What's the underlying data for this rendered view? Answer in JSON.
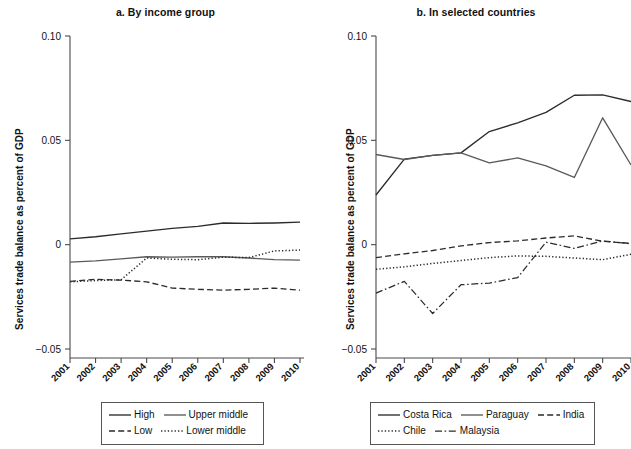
{
  "figure": {
    "background": "#ffffff",
    "line_color": "#2b2b2b",
    "gray_line_color": "#5a5a5a",
    "axis_color": "#4a4a4a"
  },
  "chart_data": [
    {
      "type": "line",
      "panel_id": "a",
      "title": "a. By income group",
      "xlabel": "",
      "ylabel": "Services trade balance as percent of GDP",
      "x": [
        2001,
        2002,
        2003,
        2004,
        2005,
        2006,
        2007,
        2008,
        2009,
        2010
      ],
      "xtick_labels": [
        "2001",
        "2002",
        "2003",
        "2004",
        "2005",
        "2006",
        "2007",
        "2008",
        "2009",
        "2010"
      ],
      "ytick_labels": [
        "0.10",
        "0.05",
        "0",
        "-0.05"
      ],
      "ytick_values": [
        0.1,
        0.05,
        0,
        -0.05
      ],
      "ylim": [
        -0.05,
        0.1
      ],
      "grid": false,
      "legend_position": "bottom",
      "series": [
        {
          "name": "High",
          "style": "solid",
          "color": "#2b2b2b",
          "values": [
            0.0028,
            0.0038,
            0.0052,
            0.0065,
            0.0078,
            0.0088,
            0.0104,
            0.0102,
            0.0104,
            0.0108
          ]
        },
        {
          "name": "Upper middle",
          "style": "solid",
          "color": "#5a5a5a",
          "values": [
            -0.0084,
            -0.0078,
            -0.0068,
            -0.0058,
            -0.006,
            -0.0058,
            -0.0058,
            -0.0064,
            -0.0072,
            -0.0074
          ]
        },
        {
          "name": "Low",
          "style": "dashed",
          "color": "#2b2b2b",
          "values": [
            -0.0176,
            -0.0166,
            -0.017,
            -0.0178,
            -0.0208,
            -0.0214,
            -0.0218,
            -0.0214,
            -0.0208,
            -0.0218
          ]
        },
        {
          "name": "Lower middle",
          "style": "dotted",
          "color": "#2b2b2b",
          "values": [
            -0.0178,
            -0.0172,
            -0.0168,
            -0.0064,
            -0.007,
            -0.0072,
            -0.006,
            -0.0062,
            -0.003,
            -0.0026
          ]
        }
      ]
    },
    {
      "type": "line",
      "panel_id": "b",
      "title": "b. In selected countries",
      "xlabel": "",
      "ylabel": "Services trade balance as percent of GDP",
      "x": [
        2001,
        2002,
        2003,
        2004,
        2005,
        2006,
        2007,
        2008,
        2009,
        2010
      ],
      "xtick_labels": [
        "2001",
        "2002",
        "2003",
        "2004",
        "2005",
        "2006",
        "2007",
        "2008",
        "2009",
        "2010"
      ],
      "ytick_labels": [
        "0.10",
        "0.05",
        "0",
        "-0.05"
      ],
      "ytick_values": [
        0.1,
        0.05,
        0,
        -0.05
      ],
      "ylim": [
        -0.05,
        0.1
      ],
      "grid": false,
      "legend_position": "bottom",
      "series": [
        {
          "name": "Costa Rica",
          "style": "solid",
          "color": "#2b2b2b",
          "values": [
            0.0238,
            0.041,
            0.0428,
            0.044,
            0.0542,
            0.0584,
            0.0634,
            0.0716,
            0.0718,
            0.0686
          ]
        },
        {
          "name": "Paraguay",
          "style": "solid",
          "color": "#5a5a5a",
          "values": [
            0.0432,
            0.0408,
            0.0428,
            0.044,
            0.0392,
            0.0416,
            0.0378,
            0.0322,
            0.0608,
            0.0382
          ]
        },
        {
          "name": "India",
          "style": "dashed",
          "color": "#2b2b2b",
          "values": [
            -0.0062,
            -0.0044,
            -0.0028,
            -0.0006,
            0.001,
            0.0018,
            0.0032,
            0.0042,
            0.0016,
            0.0006
          ]
        },
        {
          "name": "Chile",
          "style": "dotted",
          "color": "#2b2b2b",
          "values": [
            -0.0118,
            -0.0106,
            -0.009,
            -0.0076,
            -0.0062,
            -0.0054,
            -0.0056,
            -0.0064,
            -0.0072,
            -0.0046
          ]
        },
        {
          "name": "Malaysia",
          "style": "dashdot",
          "color": "#2b2b2b",
          "values": [
            -0.0232,
            -0.0176,
            -0.033,
            -0.0192,
            -0.0184,
            -0.0158,
            0.0012,
            -0.0018,
            0.0018,
            0.0004
          ]
        }
      ]
    }
  ]
}
